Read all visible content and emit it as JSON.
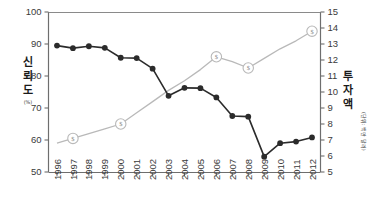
{
  "chart_data": {
    "type": "line",
    "title": "",
    "x": [
      1996,
      1997,
      1998,
      1999,
      2000,
      2001,
      2002,
      2003,
      2004,
      2005,
      2006,
      2007,
      2008,
      2009,
      2010,
      2011,
      2012
    ],
    "xtick_labels": [
      "1996",
      "1997",
      "1998",
      "1999",
      "2000",
      "2001",
      "2002",
      "2003",
      "2004",
      "2005",
      "2006",
      "2007",
      "2008",
      "2009",
      "2010",
      "2011",
      "2012"
    ],
    "xlabel": "",
    "grid": false,
    "legend_position": "none",
    "series": [
      {
        "name": "신뢰도",
        "axis": "left",
        "marker": "filled-circle",
        "color": "#2b2b2b",
        "values": [
          89.5,
          88.7,
          89.3,
          88.8,
          85.7,
          85.6,
          82.3,
          73.8,
          76.3,
          76.2,
          73.3,
          67.5,
          67.3,
          54.8,
          59.0,
          59.5,
          60.8
        ]
      },
      {
        "name": "투자액",
        "axis": "right",
        "marker": "dollar-circle",
        "color": "#b9b9b9",
        "marker_years": [
          1997,
          2000,
          2006,
          2008,
          2012
        ],
        "values": [
          6.8,
          7.1,
          7.4,
          7.7,
          8.0,
          8.7,
          9.4,
          10.1,
          10.7,
          11.4,
          12.2,
          11.9,
          11.5,
          12.1,
          12.7,
          13.2,
          13.8
        ]
      }
    ],
    "left_axis": {
      "label": "신뢰도",
      "unit": "(%)",
      "ylim": [
        50,
        100
      ],
      "ticks": [
        50,
        60,
        70,
        80,
        90,
        100
      ],
      "tick_labels": [
        "50",
        "60",
        "70",
        "80",
        "90",
        "100"
      ]
    },
    "right_axis": {
      "label": "투자액",
      "unit": "(단위: 백만 달러)",
      "ylim": [
        5,
        15
      ],
      "ticks": [
        5,
        6,
        7,
        8,
        9,
        10,
        11,
        12,
        13,
        14,
        15
      ],
      "tick_labels": [
        "5",
        "6",
        "7",
        "8",
        "9",
        "10",
        "11",
        "12",
        "13",
        "14",
        "15"
      ]
    },
    "marker_glyph": "$"
  }
}
